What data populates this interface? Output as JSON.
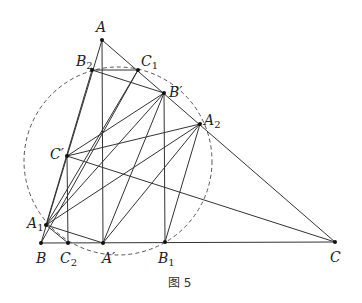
{
  "figure": {
    "caption": "图 5",
    "circle": {
      "cx": 118,
      "cy": 161,
      "r": 94
    },
    "points": {
      "A": {
        "x": 102,
        "y": 40,
        "label": "A",
        "sub": "",
        "prime": false,
        "lx": 96,
        "ly": 32
      },
      "B2": {
        "x": 92,
        "y": 70,
        "label": "B",
        "sub": "2",
        "prime": false,
        "lx": 76,
        "ly": 66
      },
      "C1": {
        "x": 138,
        "y": 70,
        "label": "C",
        "sub": "1",
        "prime": false,
        "lx": 141,
        "ly": 66
      },
      "Bp": {
        "x": 164,
        "y": 93,
        "label": "B′",
        "sub": "",
        "prime": true,
        "lx": 169,
        "ly": 97
      },
      "A2": {
        "x": 200,
        "y": 124,
        "label": "A",
        "sub": "2",
        "prime": false,
        "lx": 204,
        "ly": 125
      },
      "Cp": {
        "x": 67,
        "y": 156,
        "label": "C′",
        "sub": "",
        "prime": true,
        "lx": 50,
        "ly": 159
      },
      "A1": {
        "x": 46,
        "y": 225,
        "label": "A",
        "sub": "1",
        "prime": false,
        "lx": 27,
        "ly": 228
      },
      "B": {
        "x": 41,
        "y": 243,
        "label": "B",
        "sub": "",
        "prime": false,
        "lx": 36,
        "ly": 263
      },
      "C2": {
        "x": 68,
        "y": 243,
        "label": "C",
        "sub": "2",
        "prime": false,
        "lx": 60,
        "ly": 263
      },
      "Ap": {
        "x": 103,
        "y": 243,
        "label": "A′",
        "sub": "",
        "prime": true,
        "lx": 102,
        "ly": 263
      },
      "B1": {
        "x": 165,
        "y": 242,
        "label": "B",
        "sub": "1",
        "prime": false,
        "lx": 158,
        "ly": 263
      },
      "C": {
        "x": 335,
        "y": 242,
        "label": "C",
        "sub": "",
        "prime": false,
        "lx": 330,
        "ly": 262
      }
    },
    "segments": [
      [
        "A",
        "B"
      ],
      [
        "A",
        "C"
      ],
      [
        "B",
        "C"
      ],
      [
        "A",
        "Ap"
      ],
      [
        "Bp",
        "B1"
      ],
      [
        "Cp",
        "C2"
      ],
      [
        "B2",
        "C1"
      ],
      [
        "B2",
        "Bp"
      ],
      [
        "B2",
        "A1"
      ],
      [
        "C1",
        "B"
      ],
      [
        "C1",
        "A1"
      ],
      [
        "Bp",
        "Cp"
      ],
      [
        "Bp",
        "A1"
      ],
      [
        "Bp",
        "Ap"
      ],
      [
        "A2",
        "A1"
      ],
      [
        "A2",
        "Ap"
      ],
      [
        "A2",
        "B1"
      ],
      [
        "A2",
        "Cp"
      ],
      [
        "Cp",
        "C"
      ],
      [
        "A1",
        "Ap"
      ],
      [
        "A1",
        "C2"
      ]
    ]
  }
}
